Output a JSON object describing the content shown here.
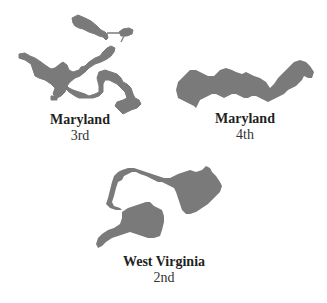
{
  "districts": [
    {
      "state": "Maryland",
      "rank": "3rd"
    },
    {
      "state": "Maryland",
      "rank": "4th"
    },
    {
      "state": "West Virginia",
      "rank": "2nd"
    }
  ],
  "colors": {
    "shape_fill": "#7a7a7a",
    "text": "#1f1f1f",
    "background": "#ffffff"
  }
}
